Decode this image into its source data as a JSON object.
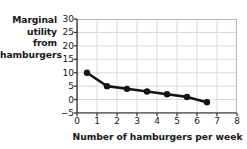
{
  "chart_data": {
    "type": "line",
    "title": "",
    "xlabel": "Number of hamburgers per week",
    "ylabel": "Marginal utility from hamburgers",
    "ylabel_lines": [
      "Marginal",
      "utility",
      "from",
      "hamburgers"
    ],
    "x": [
      0.5,
      1.5,
      2.5,
      3.5,
      4.5,
      5.5,
      6.5
    ],
    "values": [
      10,
      5,
      4,
      3,
      2,
      1,
      -1
    ],
    "series": [
      {
        "name": "Marginal utility",
        "x": [
          0.5,
          1.5,
          2.5,
          3.5,
          4.5,
          5.5,
          6.5
        ],
        "values": [
          10,
          5,
          4,
          3,
          2,
          1,
          -1
        ]
      }
    ],
    "xlim": [
      0,
      8
    ],
    "ylim": [
      -5,
      30
    ],
    "xticks": [
      0,
      1,
      2,
      3,
      4,
      5,
      6,
      7,
      8
    ],
    "xtick_labels": [
      "0",
      "1",
      "2",
      "3",
      "4",
      "5",
      "6",
      "7",
      "8"
    ],
    "yticks": [
      -5,
      0,
      5,
      10,
      15,
      20,
      25,
      30
    ],
    "ytick_labels": [
      "-5",
      "0",
      "5",
      "10",
      "15",
      "20",
      "25",
      "30"
    ],
    "grid": true,
    "legend": false,
    "colors": {
      "line": "#141414",
      "marker": "#141414",
      "grid": "#d8d8d8",
      "axis": "#5a5a5a",
      "text": "#171717",
      "background": "#ffffff"
    },
    "style": {
      "line_width": 2.6,
      "marker_radius": 3.2,
      "marker_shape": "circle"
    }
  }
}
